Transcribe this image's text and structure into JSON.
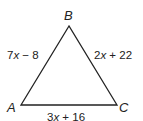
{
  "figure": {
    "type": "triangle",
    "vertices": {
      "A": "A",
      "B": "B",
      "C": "C"
    },
    "sides": {
      "AB": {
        "coef": "7",
        "var": "x",
        "op": " − ",
        "const": "8",
        "text": "7x − 8"
      },
      "BC": {
        "coef": "2",
        "var": "x",
        "op": " + ",
        "const": "22",
        "text": "2x + 22"
      },
      "AC": {
        "coef": "3",
        "var": "x",
        "op": " + ",
        "const": "16",
        "text": "3x + 16"
      }
    },
    "line_color": "#222222"
  }
}
